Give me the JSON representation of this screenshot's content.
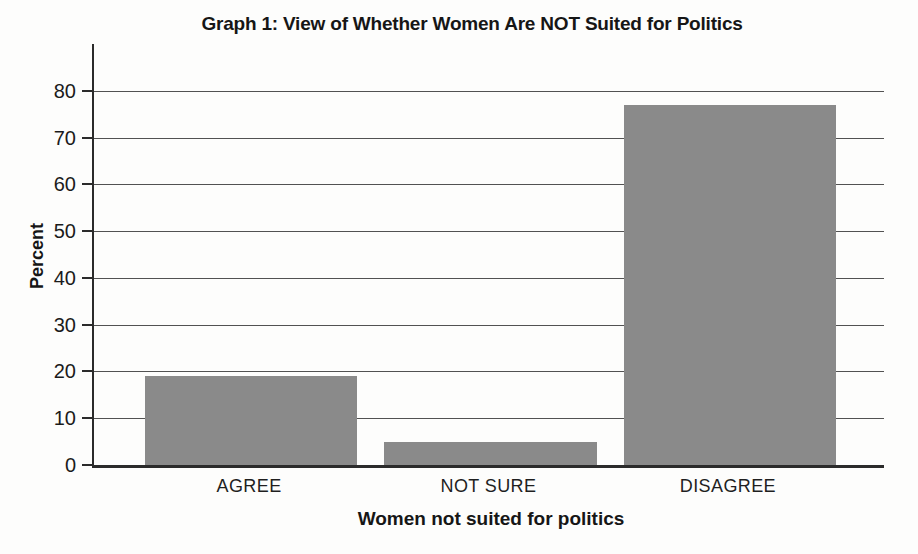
{
  "chart_data": {
    "type": "bar",
    "title": "Graph 1: View of Whether Women Are NOT Suited for Politics",
    "xlabel": "Women not suited for politics",
    "ylabel": "Percent",
    "categories": [
      "AGREE",
      "NOT SURE",
      "DISAGREE"
    ],
    "values": [
      19,
      5,
      77
    ],
    "ylim": [
      0,
      90
    ],
    "yticks": [
      0,
      10,
      20,
      30,
      40,
      50,
      60,
      70,
      80
    ],
    "grid": true,
    "legend_position": "none",
    "bar_color": "#8a8a8a"
  },
  "colors": {
    "background": "#fdfdfc",
    "axis": "#2b2b2b",
    "gridline": "#525252",
    "text": "#1b1b1b",
    "bar": "#8a8a8a"
  }
}
